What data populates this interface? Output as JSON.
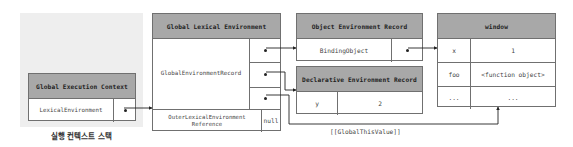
{
  "stack": {
    "caption": "실행 컨텍스트 스택",
    "context": {
      "title": "Global Execution Context",
      "row_label": "LexicalEnvironment"
    }
  },
  "global_lexical_environment": {
    "title": "Global Lexical Environment",
    "record_label": "GlobalEnvironmentRecord",
    "outer_label": "OuterLexicalEnvironment Reference",
    "outer_value": "null"
  },
  "object_environment_record": {
    "title": "Object Environment Record",
    "row_label": "BindingObject"
  },
  "declarative_environment_record": {
    "title": "Declarative Environment Record",
    "rows": [
      {
        "name": "y",
        "value": "2"
      }
    ]
  },
  "window": {
    "title": "window",
    "rows": [
      {
        "name": "x",
        "value": "1"
      },
      {
        "name": "foo",
        "value": "<function object>"
      },
      {
        "name": "...",
        "value": "..."
      }
    ]
  },
  "connectors": {
    "global_this_label": "[[GlobalThisValue]]"
  },
  "colors": {
    "header_bg": "#a8a8a8",
    "border": "#707070",
    "stack_bg": "#eeeeee",
    "line": "#222222"
  }
}
